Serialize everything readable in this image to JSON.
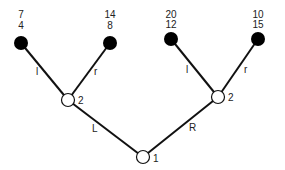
{
  "diagram": {
    "type": "game-tree",
    "root": {
      "label": "1"
    },
    "player2_left": {
      "label": "2"
    },
    "player2_right": {
      "label": "2"
    },
    "edges": {
      "root_left": "L",
      "root_right": "R",
      "left_l": "l",
      "left_r": "r",
      "right_l": "l",
      "right_r": "r"
    },
    "payoffs": [
      {
        "top": "7",
        "bottom": "4"
      },
      {
        "top": "14",
        "bottom": "8"
      },
      {
        "top": "20",
        "bottom": "12"
      },
      {
        "top": "10",
        "bottom": "15"
      }
    ],
    "colors": {
      "line": "#111111",
      "terminal": "#000000",
      "decision": "#ffffff"
    }
  }
}
